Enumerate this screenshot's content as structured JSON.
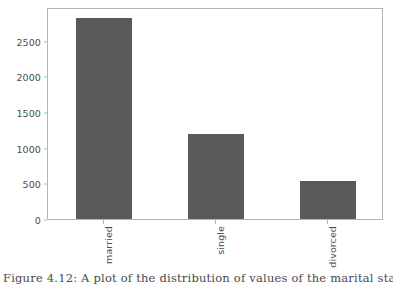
{
  "figure": {
    "caption": "Figure 4.12: A plot of the distribution of values of the marital status"
  },
  "chart_data": {
    "type": "bar",
    "title": "",
    "xlabel": "",
    "ylabel": "",
    "categories": [
      "married",
      "single",
      "divorced"
    ],
    "values": [
      2820,
      1195,
      535
    ],
    "ylim": [
      0,
      2975
    ],
    "yticks": [
      0,
      500,
      1000,
      1500,
      2000,
      2500
    ],
    "ytick_labels": [
      "0",
      "500",
      "1000",
      "1500",
      "2000",
      "2500"
    ],
    "grid": false,
    "legend": null,
    "legend_position": "none",
    "bar_color": "#595959",
    "background_color": "#ffffff",
    "axis_color": "#b5b5b5",
    "tick_label_color": "#4d4d4d",
    "xtick_rotation": 90
  }
}
